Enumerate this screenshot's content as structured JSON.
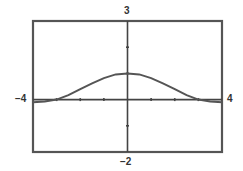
{
  "chart_data": {
    "type": "line",
    "title": "",
    "xlabel": "",
    "ylabel": "",
    "xlim": [
      -4,
      4
    ],
    "ylim": [
      -2,
      3
    ],
    "grid": false,
    "x_ticks": [
      -3,
      -2,
      -1,
      1,
      2,
      3
    ],
    "y_ticks": [
      -1,
      1,
      2
    ],
    "window_labels": {
      "xmin": "−4",
      "xmax": "4",
      "ymin": "−2",
      "ymax": "3"
    },
    "series": [
      {
        "name": "f(x)",
        "x": [
          -4,
          -3.5,
          -3,
          -2.5,
          -2,
          -1.5,
          -1,
          -0.5,
          0,
          0.5,
          1,
          1.5,
          2,
          2.5,
          3,
          3.5,
          4
        ],
        "y": [
          -0.1,
          -0.07,
          0.0,
          0.17,
          0.4,
          0.62,
          0.82,
          0.96,
          1.0,
          0.96,
          0.82,
          0.62,
          0.4,
          0.17,
          0.0,
          -0.07,
          -0.1
        ]
      }
    ]
  },
  "colors": {
    "frame": "#555555",
    "axis": "#444444",
    "curve": "#555555"
  }
}
